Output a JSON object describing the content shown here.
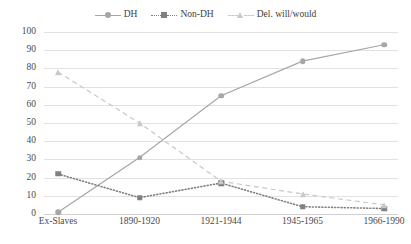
{
  "chart_data": {
    "type": "line",
    "title": "",
    "subtitle": "",
    "xlabel": "",
    "ylabel": "",
    "ylim": [
      0,
      100
    ],
    "ytick_step": 10,
    "yticks": [
      "100",
      "90",
      "80",
      "70",
      "60",
      "50",
      "40",
      "30",
      "20",
      "10",
      "0"
    ],
    "grid": true,
    "legend_position": "top-center",
    "categories": [
      "Ex-Slaves",
      "1890-1920",
      "1921-1944",
      "1945-1965",
      "1966-1990"
    ],
    "series": [
      {
        "name": "DH",
        "values": [
          1,
          31,
          65,
          84,
          93
        ],
        "color": "#a6a6a6",
        "line_style": "solid",
        "marker": "circle"
      },
      {
        "name": "Non-DH",
        "values": [
          22,
          9,
          17,
          4,
          3
        ],
        "color": "#808080",
        "line_style": "dotted",
        "marker": "square"
      },
      {
        "name": "Del. will/would",
        "values": [
          78,
          50,
          18,
          11,
          5
        ],
        "color": "#c8c8c8",
        "line_style": "dashed",
        "marker": "triangle"
      }
    ]
  },
  "legend": {
    "items": [
      {
        "label": "DH",
        "icon": "line-circle-marker-icon"
      },
      {
        "label": "Non-DH",
        "icon": "line-square-marker-icon"
      },
      {
        "label": "Del. will/would",
        "icon": "line-triangle-marker-icon"
      }
    ]
  },
  "colors": {
    "dh": "#a6a6a6",
    "non_dh": "#808080",
    "del_will_would": "#c8c8c8",
    "gridline": "#e2e2e2",
    "text": "#4a4a4a",
    "background": "#ffffff"
  }
}
